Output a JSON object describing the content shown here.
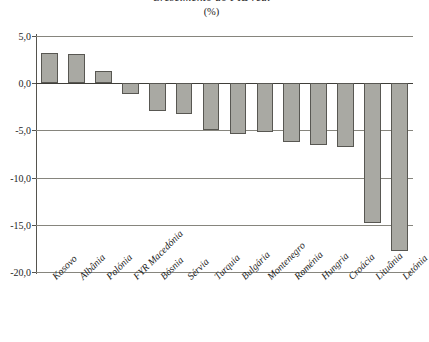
{
  "chart_data": {
    "type": "bar",
    "title": "Crescimento do PIB real",
    "subtitle": "(%)",
    "xlabel": "",
    "ylabel": "",
    "ylim": [
      -20.0,
      5.0
    ],
    "ytick_labels": [
      "5,0",
      "0,0",
      "-5,0",
      "-10,0",
      "-15,0",
      "-20,0"
    ],
    "ytick_values": [
      5.0,
      0.0,
      -5.0,
      -10.0,
      -15.0,
      -20.0
    ],
    "grid": true,
    "legend": "none",
    "decimal_separator": ",",
    "bar_color": "#a9a9a3",
    "bar_edge_color": "#585752",
    "categories": [
      "Kosovo",
      "Albânia",
      "Polónia",
      "FYR Macedónia",
      "Bósnia",
      "Sérvia",
      "Turquia",
      "Bulgária",
      "Montenegro",
      "Roménia",
      "Hungria",
      "Croácia",
      "Lituânia",
      "Letónia"
    ],
    "values": [
      3.2,
      3.1,
      1.3,
      -1.1,
      -2.9,
      -3.3,
      -5.0,
      -5.4,
      -5.2,
      -6.2,
      -6.5,
      -6.8,
      -14.8,
      -17.8
    ]
  }
}
